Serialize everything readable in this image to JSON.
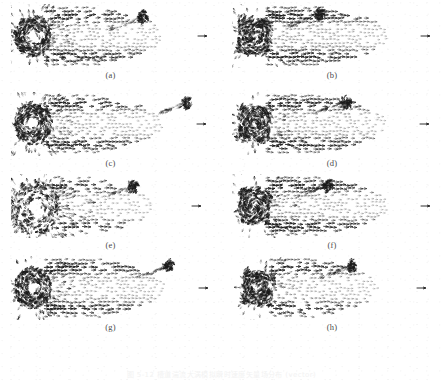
{
  "figure": {
    "caption": "图 5-12  槽道湍流大涡模拟瞬时速度矢量场分布 (vector)",
    "panel_count": 8,
    "columns": 2,
    "rows": 4,
    "ink_color": "#1a1a1a",
    "background_color": "#ffffff"
  },
  "panels": [
    {
      "label": "(a)",
      "name": "panel-a",
      "core": "ring",
      "core_intensity": 0.92,
      "burst": 0.55,
      "tail_density": 0.7,
      "seed": 11
    },
    {
      "label": "(b)",
      "name": "panel-b",
      "core": "block",
      "core_intensity": 1.0,
      "burst": 0.3,
      "tail_density": 0.78,
      "seed": 23
    },
    {
      "label": "(c)",
      "name": "panel-c",
      "core": "ring",
      "core_intensity": 0.9,
      "burst": 0.5,
      "tail_density": 0.68,
      "seed": 37
    },
    {
      "label": "(d)",
      "name": "panel-d",
      "core": "block",
      "core_intensity": 0.98,
      "burst": 0.32,
      "tail_density": 0.74,
      "seed": 41
    },
    {
      "label": "(e)",
      "name": "panel-e",
      "core": "star",
      "core_intensity": 0.7,
      "burst": 1.0,
      "tail_density": 0.55,
      "seed": 59
    },
    {
      "label": "(f)",
      "name": "panel-f",
      "core": "block",
      "core_intensity": 0.99,
      "burst": 0.34,
      "tail_density": 0.76,
      "seed": 67
    },
    {
      "label": "(g)",
      "name": "panel-g",
      "core": "ring",
      "core_intensity": 0.94,
      "burst": 0.4,
      "tail_density": 0.72,
      "seed": 73
    },
    {
      "label": "(h)",
      "name": "panel-h",
      "core": "block",
      "core_intensity": 0.96,
      "burst": 0.26,
      "tail_density": 0.62,
      "seed": 89
    }
  ],
  "chart_data": {
    "type": "scatter",
    "title": "图 5-12  槽道湍流大涡模拟瞬时速度矢量场分布 (vector)",
    "subtitle": "",
    "xlabel": "",
    "ylabel": "",
    "xlim": [
      0,
      200
    ],
    "ylim": [
      0,
      64
    ],
    "grid": false,
    "legend": "none",
    "series": [
      {
        "name": "(a)",
        "core_x": 22,
        "core_y": 32,
        "core_radius": 15,
        "core_intensity": 0.92,
        "tail_length": 150,
        "tail_density": 0.7,
        "burst": 0.55,
        "secondary_vortex_x": 132,
        "secondary_vortex_y": 13,
        "tip_arrow_x": 194
      },
      {
        "name": "(b)",
        "core_x": 22,
        "core_y": 32,
        "core_radius": 16,
        "core_intensity": 1.0,
        "tail_length": 155,
        "tail_density": 0.78,
        "burst": 0.3,
        "secondary_vortex_x": 88,
        "secondary_vortex_y": 10,
        "tip_arrow_x": 196
      },
      {
        "name": "(c)",
        "core_x": 22,
        "core_y": 32,
        "core_radius": 15,
        "core_intensity": 0.9,
        "tail_length": 150,
        "tail_density": 0.68,
        "burst": 0.5,
        "secondary_vortex_x": 176,
        "secondary_vortex_y": 11,
        "tip_arrow_x": 193
      },
      {
        "name": "(d)",
        "core_x": 22,
        "core_y": 32,
        "core_radius": 16,
        "core_intensity": 0.98,
        "tail_length": 152,
        "tail_density": 0.74,
        "burst": 0.32,
        "secondary_vortex_x": 114,
        "secondary_vortex_y": 10,
        "tip_arrow_x": 195
      },
      {
        "name": "(e)",
        "core_x": 24,
        "core_y": 34,
        "core_radius": 20,
        "core_intensity": 0.7,
        "tail_length": 140,
        "tail_density": 0.55,
        "burst": 1.0,
        "secondary_vortex_x": 122,
        "secondary_vortex_y": 12,
        "tip_arrow_x": 188
      },
      {
        "name": "(f)",
        "core_x": 22,
        "core_y": 32,
        "core_radius": 16,
        "core_intensity": 0.99,
        "tail_length": 155,
        "tail_density": 0.76,
        "burst": 0.34,
        "secondary_vortex_x": 96,
        "secondary_vortex_y": 11,
        "tip_arrow_x": 196
      },
      {
        "name": "(g)",
        "core_x": 22,
        "core_y": 32,
        "core_radius": 15,
        "core_intensity": 0.94,
        "tail_length": 152,
        "tail_density": 0.72,
        "burst": 0.4,
        "secondary_vortex_x": 158,
        "secondary_vortex_y": 10,
        "tip_arrow_x": 195
      },
      {
        "name": "(h)",
        "core_x": 26,
        "core_y": 32,
        "core_radius": 15,
        "core_intensity": 0.96,
        "tail_length": 145,
        "tail_density": 0.62,
        "burst": 0.26,
        "secondary_vortex_x": 120,
        "secondary_vortex_y": 10,
        "tip_arrow_x": 192
      }
    ]
  }
}
